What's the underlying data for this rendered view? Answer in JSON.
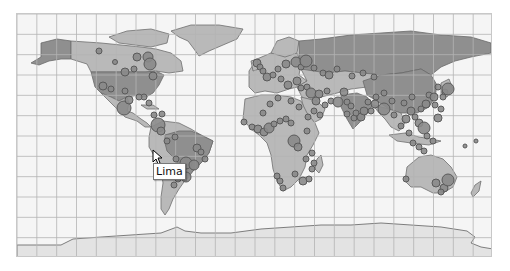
{
  "map": {
    "projection": "equirectangular world map",
    "grid": {
      "columns": 24,
      "rows": 12
    },
    "colors": {
      "ocean": "#f5f5f5",
      "land_default": "#b9b9b9",
      "land_highlight": "#8f8f8f",
      "antarctica": "#e3e3e3",
      "border": "#6e6e6e",
      "marker_fill": "#8a8a8a",
      "marker_stroke": "#5a5a5a",
      "grid": "#b4b4b4"
    },
    "highlighted_countries": [
      "United States",
      "Brazil",
      "Russia",
      "China",
      "India"
    ],
    "tooltip": {
      "label": "Lima",
      "visible": true
    },
    "markers": [
      [
        98,
        50,
        3
      ],
      [
        114,
        61,
        2.5
      ],
      [
        124,
        71,
        4
      ],
      [
        133,
        68,
        3
      ],
      [
        136,
        56,
        4
      ],
      [
        147,
        56,
        5
      ],
      [
        149,
        63,
        6
      ],
      [
        152,
        75,
        4
      ],
      [
        143,
        96,
        3
      ],
      [
        102,
        85,
        4
      ],
      [
        110,
        88,
        3
      ],
      [
        124,
        90,
        3
      ],
      [
        123,
        107,
        7
      ],
      [
        128,
        99,
        4
      ],
      [
        138,
        96,
        3
      ],
      [
        148,
        102,
        3
      ],
      [
        153,
        114,
        3
      ],
      [
        161,
        113,
        3
      ],
      [
        157,
        124,
        7
      ],
      [
        160,
        130,
        4
      ],
      [
        166,
        140,
        3
      ],
      [
        174,
        136,
        3
      ],
      [
        175,
        158,
        3
      ],
      [
        179,
        167,
        4
      ],
      [
        185,
        162,
        6
      ],
      [
        193,
        164,
        5
      ],
      [
        196,
        147,
        4
      ],
      [
        200,
        151,
        3
      ],
      [
        204,
        158,
        3
      ],
      [
        185,
        176,
        5
      ],
      [
        177,
        178,
        3
      ],
      [
        173,
        184,
        3
      ],
      [
        256,
        62,
        4
      ],
      [
        259,
        66,
        3
      ],
      [
        262,
        70,
        3
      ],
      [
        266,
        76,
        4
      ],
      [
        272,
        74,
        3
      ],
      [
        277,
        68,
        3
      ],
      [
        280,
        78,
        3
      ],
      [
        285,
        63,
        4
      ],
      [
        295,
        61,
        5
      ],
      [
        300,
        66,
        3
      ],
      [
        305,
        60,
        6
      ],
      [
        313,
        67,
        3
      ],
      [
        322,
        72,
        3
      ],
      [
        328,
        74,
        4
      ],
      [
        336,
        68,
        3
      ],
      [
        351,
        75,
        3
      ],
      [
        362,
        72,
        3
      ],
      [
        373,
        76,
        3
      ],
      [
        287,
        84,
        4
      ],
      [
        296,
        80,
        4
      ],
      [
        300,
        87,
        3
      ],
      [
        306,
        86,
        3
      ],
      [
        310,
        92,
        5
      ],
      [
        318,
        93,
        4
      ],
      [
        326,
        90,
        3
      ],
      [
        330,
        100,
        3
      ],
      [
        315,
        100,
        4
      ],
      [
        324,
        104,
        3
      ],
      [
        337,
        101,
        5
      ],
      [
        343,
        91,
        4
      ],
      [
        346,
        113,
        3
      ],
      [
        353,
        117,
        3
      ],
      [
        360,
        116,
        4
      ],
      [
        346,
        101,
        3
      ],
      [
        350,
        105,
        3
      ],
      [
        355,
        112,
        3
      ],
      [
        363,
        110,
        4
      ],
      [
        370,
        110,
        3
      ],
      [
        374,
        103,
        4
      ],
      [
        367,
        101,
        3
      ],
      [
        375,
        96,
        3
      ],
      [
        383,
        92,
        3
      ],
      [
        391,
        100,
        3
      ],
      [
        383,
        108,
        6
      ],
      [
        393,
        114,
        3
      ],
      [
        403,
        102,
        3
      ],
      [
        411,
        96,
        3
      ],
      [
        410,
        110,
        4
      ],
      [
        414,
        116,
        3
      ],
      [
        405,
        118,
        4
      ],
      [
        400,
        125,
        3
      ],
      [
        408,
        132,
        3
      ],
      [
        420,
        108,
        3
      ],
      [
        425,
        103,
        4
      ],
      [
        428,
        94,
        3
      ],
      [
        433,
        96,
        4
      ],
      [
        434,
        104,
        3
      ],
      [
        444,
        91,
        3
      ],
      [
        442,
        96,
        3
      ],
      [
        437,
        86,
        3
      ],
      [
        447,
        88,
        6
      ],
      [
        440,
        108,
        3
      ],
      [
        437,
        117,
        4
      ],
      [
        412,
        142,
        3
      ],
      [
        418,
        146,
        3
      ],
      [
        423,
        150,
        3
      ],
      [
        418,
        122,
        4
      ],
      [
        423,
        127,
        6
      ],
      [
        426,
        135,
        3
      ],
      [
        432,
        140,
        3
      ],
      [
        243,
        121,
        3
      ],
      [
        251,
        126,
        3
      ],
      [
        257,
        128,
        4
      ],
      [
        263,
        131,
        4
      ],
      [
        268,
        127,
        5
      ],
      [
        273,
        123,
        3
      ],
      [
        279,
        120,
        3
      ],
      [
        285,
        118,
        3
      ],
      [
        290,
        122,
        3
      ],
      [
        293,
        140,
        6
      ],
      [
        297,
        146,
        4
      ],
      [
        305,
        158,
        3
      ],
      [
        311,
        152,
        3
      ],
      [
        313,
        162,
        3
      ],
      [
        294,
        173,
        3
      ],
      [
        302,
        180,
        4
      ],
      [
        308,
        178,
        3
      ],
      [
        311,
        168,
        3
      ],
      [
        279,
        180,
        3
      ],
      [
        276,
        175,
        3
      ],
      [
        282,
        187,
        3
      ],
      [
        307,
        116,
        3
      ],
      [
        313,
        110,
        3
      ],
      [
        319,
        114,
        3
      ],
      [
        306,
        130,
        3
      ],
      [
        298,
        106,
        3
      ],
      [
        290,
        100,
        3
      ],
      [
        277,
        97,
        3
      ],
      [
        269,
        103,
        3
      ],
      [
        262,
        112,
        3
      ],
      [
        405,
        178,
        3
      ],
      [
        435,
        182,
        4
      ],
      [
        443,
        187,
        4
      ],
      [
        447,
        179,
        6
      ],
      [
        440,
        191,
        3
      ],
      [
        464,
        145,
        2
      ],
      [
        475,
        140,
        2
      ]
    ]
  },
  "window": {
    "width": 510,
    "height": 271
  }
}
